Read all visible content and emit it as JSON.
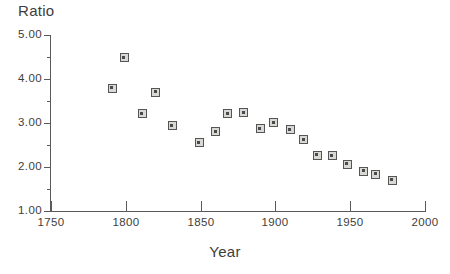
{
  "chart_data": {
    "type": "scatter",
    "title": "",
    "ylabel": "Ratio",
    "xlabel": "Year",
    "xlim": [
      1750,
      2000
    ],
    "ylim": [
      1.0,
      5.0
    ],
    "grid": false,
    "legend": null,
    "marker_style": "open-square-with-center-dot",
    "xticks": [
      {
        "value": 1750,
        "label": "1750"
      },
      {
        "value": 1800,
        "label": "1800"
      },
      {
        "value": 1850,
        "label": "1850"
      },
      {
        "value": 1900,
        "label": "1900"
      },
      {
        "value": 1950,
        "label": "1950"
      },
      {
        "value": 2000,
        "label": "2000"
      }
    ],
    "xminorticks": [],
    "yticks": [
      {
        "value": 5.0,
        "label": "5.00",
        "kind": "major"
      },
      {
        "value": 4.5,
        "label": "",
        "kind": "minor"
      },
      {
        "value": 4.0,
        "label": "4.00",
        "kind": "major"
      },
      {
        "value": 3.5,
        "label": "",
        "kind": "minor"
      },
      {
        "value": 3.0,
        "label": "3.00",
        "kind": "major"
      },
      {
        "value": 2.5,
        "label": "",
        "kind": "minor"
      },
      {
        "value": 2.0,
        "label": "2.00",
        "kind": "major"
      },
      {
        "value": 1.5,
        "label": "",
        "kind": "minor"
      },
      {
        "value": 1.0,
        "label": "1.00",
        "kind": "major"
      }
    ],
    "points": [
      {
        "x": 1791,
        "y": 3.79
      },
      {
        "x": 1799,
        "y": 4.48
      },
      {
        "x": 1811,
        "y": 3.21
      },
      {
        "x": 1820,
        "y": 3.7
      },
      {
        "x": 1831,
        "y": 2.94
      },
      {
        "x": 1849,
        "y": 2.55
      },
      {
        "x": 1860,
        "y": 2.8
      },
      {
        "x": 1868,
        "y": 3.21
      },
      {
        "x": 1879,
        "y": 3.23
      },
      {
        "x": 1890,
        "y": 2.87
      },
      {
        "x": 1899,
        "y": 3.01
      },
      {
        "x": 1910,
        "y": 2.85
      },
      {
        "x": 1919,
        "y": 2.62
      },
      {
        "x": 1928,
        "y": 2.27
      },
      {
        "x": 1938,
        "y": 2.26
      },
      {
        "x": 1948,
        "y": 2.06
      },
      {
        "x": 1959,
        "y": 1.9
      },
      {
        "x": 1967,
        "y": 1.83
      },
      {
        "x": 1978,
        "y": 1.7
      }
    ]
  },
  "colors": {
    "axis": "#5a5a5a",
    "text": "#3d3d3d",
    "marker_edge": "#555555",
    "marker_fill": "#d8d8d4",
    "marker_center": "#4a4a4a",
    "background": "#ffffff"
  }
}
